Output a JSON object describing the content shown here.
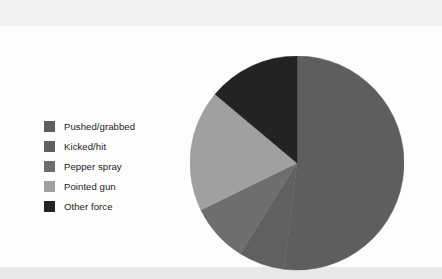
{
  "figure": {
    "background_color": "#fdfdfd",
    "band_color": "#f2f2f2"
  },
  "legend": {
    "position": "left",
    "items": [
      {
        "label": "Pushed/grabbed",
        "color": "#5e5e5e"
      },
      {
        "label": "Kicked/hit",
        "color": "#606060"
      },
      {
        "label": "Pepper spray",
        "color": "#6e6e6e"
      },
      {
        "label": "Pointed gun",
        "color": "#a0a0a0"
      },
      {
        "label": "Other force",
        "color": "#232323"
      }
    ]
  },
  "chart_data": {
    "type": "pie",
    "title": "",
    "xlabel": "",
    "ylabel": "",
    "legend_position": "left",
    "grid": false,
    "start_angle_deg": 0,
    "direction": "clockwise",
    "center": {
      "x": 297,
      "y": 163
    },
    "radius": 107,
    "labels": [
      "Pushed/grabbed",
      "Kicked/hit",
      "Pepper spray",
      "Pointed gun",
      "Other force"
    ],
    "values": [
      52,
      7,
      9,
      18,
      14
    ],
    "colors": [
      "#5e5e5e",
      "#606060",
      "#6e6e6e",
      "#a0a0a0",
      "#232323"
    ],
    "slices": [
      {
        "label": "Pushed/grabbed",
        "value": 52,
        "color": "#5e5e5e",
        "start_deg": 0,
        "end_deg": 187
      },
      {
        "label": "Kicked/hit",
        "value": 7,
        "color": "#606060",
        "start_deg": 187,
        "end_deg": 212
      },
      {
        "label": "Pepper spray",
        "value": 9,
        "color": "#6e6e6e",
        "start_deg": 212,
        "end_deg": 244
      },
      {
        "label": "Pointed gun",
        "value": 18,
        "color": "#a0a0a0",
        "start_deg": 244,
        "end_deg": 310
      },
      {
        "label": "Other force",
        "value": 14,
        "color": "#232323",
        "start_deg": 310,
        "end_deg": 360
      }
    ]
  }
}
